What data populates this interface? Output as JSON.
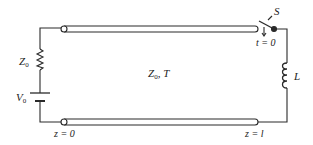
{
  "diagram": {
    "labels": {
      "source_impedance": "Z",
      "source_impedance_sub": "0",
      "source_voltage": "V",
      "source_voltage_sub": "0",
      "line_params": "Z",
      "line_params_sub": "0",
      "line_params_suffix": ", T",
      "switch": "S",
      "switch_time": "t = 0",
      "inductor": "L",
      "z_start": "z = 0",
      "z_end": "z = l"
    },
    "colors": {
      "stroke": "#2a2a2a",
      "background": "#ffffff"
    }
  }
}
